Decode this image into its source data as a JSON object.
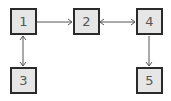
{
  "diagram": {
    "nodes": [
      {
        "id": "1",
        "label": "1",
        "x": 10,
        "y": 8
      },
      {
        "id": "2",
        "label": "2",
        "x": 73,
        "y": 8
      },
      {
        "id": "4",
        "label": "4",
        "x": 136,
        "y": 8
      },
      {
        "id": "3",
        "label": "3",
        "x": 10,
        "y": 67
      },
      {
        "id": "5",
        "label": "5",
        "x": 136,
        "y": 67
      }
    ],
    "edges": [
      {
        "from": "1",
        "to": "2",
        "direction": "forward"
      },
      {
        "from": "2",
        "to": "4",
        "direction": "both"
      },
      {
        "from": "1",
        "to": "3",
        "direction": "both"
      },
      {
        "from": "4",
        "to": "5",
        "direction": "forward"
      }
    ],
    "colors": {
      "node_fill": "#e6e6e6",
      "node_border": "#2a2a2a",
      "edge": "#555555",
      "text": "#555555"
    }
  }
}
